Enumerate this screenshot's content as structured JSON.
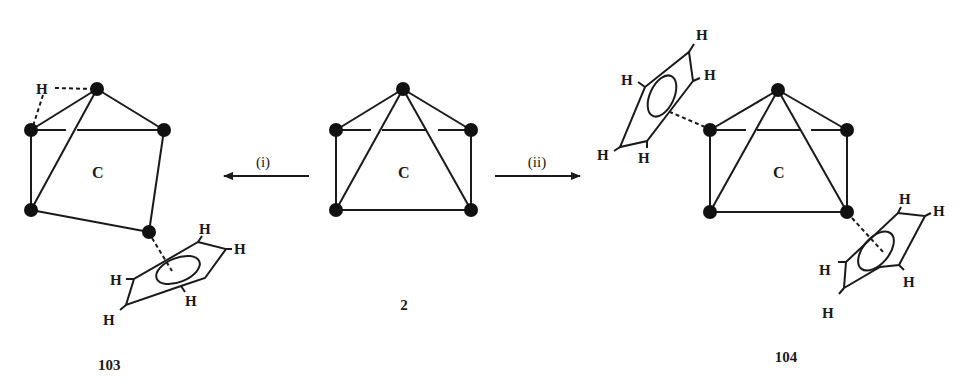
{
  "figure": {
    "colors": {
      "ink": "#1a1a1a",
      "vertex": "#111111",
      "background": "#ffffff"
    },
    "compounds": [
      {
        "id": "103",
        "label": "103",
        "core_label": "C",
        "bridging_h_label": "H",
        "ring_h_labels": [
          "H",
          "H",
          "H",
          "H",
          "H"
        ]
      },
      {
        "id": "2",
        "label": "2",
        "core_label": "C"
      },
      {
        "id": "104",
        "label": "104",
        "core_label": "C",
        "ring1_h_labels": [
          "H",
          "H",
          "H",
          "H",
          "H"
        ],
        "ring2_h_labels": [
          "H",
          "H",
          "H",
          "H",
          "H"
        ]
      }
    ],
    "reactions": [
      {
        "id": "i",
        "label": "(i)",
        "direction": "left",
        "from": "2",
        "to": "103"
      },
      {
        "id": "ii",
        "label": "(ii)",
        "direction": "right",
        "from": "2",
        "to": "104"
      }
    ]
  }
}
